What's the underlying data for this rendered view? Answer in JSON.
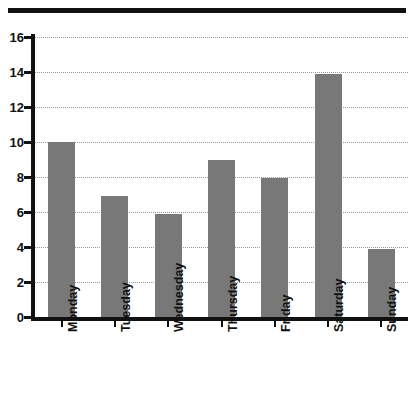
{
  "chart_data": {
    "type": "bar",
    "title": "",
    "subtitle": "",
    "xlabel": "",
    "ylabel": "",
    "categories": [
      "Monday",
      "Tuesday",
      "Wednesday",
      "Thursday",
      "Friday",
      "Saturday",
      "Sunday"
    ],
    "values": [
      10.0,
      6.9,
      5.9,
      9.0,
      7.95,
      13.9,
      3.9
    ],
    "ylim": [
      0,
      16
    ],
    "ytick_labels": [
      "0",
      "2",
      "4",
      "6",
      "8",
      "10",
      "12",
      "14",
      "16"
    ],
    "ytick_values": [
      0,
      2,
      4,
      6,
      8,
      10,
      12,
      14,
      16
    ],
    "grid": "horizontal-dotted",
    "legend": "none",
    "bar_color": "#787878",
    "axis_color": "#111111",
    "gridline_color": "#9a9a9a",
    "background_color": "#ffffff",
    "xtick_label_rotation": 90,
    "top_rule": true
  }
}
